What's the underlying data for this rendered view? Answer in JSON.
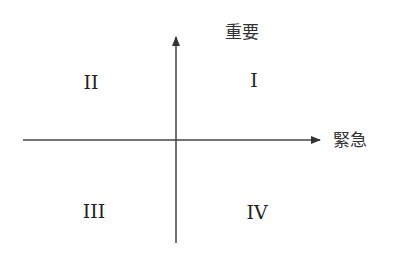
{
  "diagram": {
    "type": "quadrant",
    "axes": {
      "vertical": {
        "label": "重要",
        "direction": "up"
      },
      "horizontal": {
        "label": "緊急",
        "direction": "right"
      }
    },
    "quadrants": [
      {
        "id": "I",
        "label": "I",
        "position": "top-right"
      },
      {
        "id": "II",
        "label": "II",
        "position": "top-left"
      },
      {
        "id": "III",
        "label": "III",
        "position": "bottom-left"
      },
      {
        "id": "IV",
        "label": "IV",
        "position": "bottom-right"
      }
    ],
    "colors": {
      "line": "#333333",
      "text": "#222222",
      "background": "#ffffff"
    }
  }
}
